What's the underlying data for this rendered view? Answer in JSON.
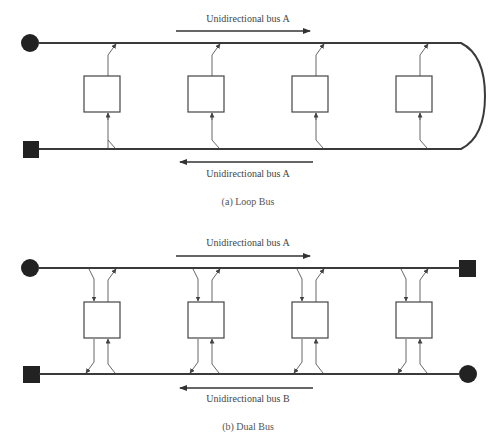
{
  "loop_bus": {
    "label_top": "Unidirectional bus A",
    "label_bottom": "Unidirectional bus A",
    "caption": "(a) Loop Bus",
    "station_count": 4
  },
  "dual_bus": {
    "label_top": "Unidirectional bus A",
    "label_bottom": "Unidirectional bus B",
    "caption": "(b) Dual Bus",
    "station_count": 4
  },
  "colors": {
    "line": "#3a3a3a",
    "terminator": "#222222",
    "text": "#444444"
  }
}
